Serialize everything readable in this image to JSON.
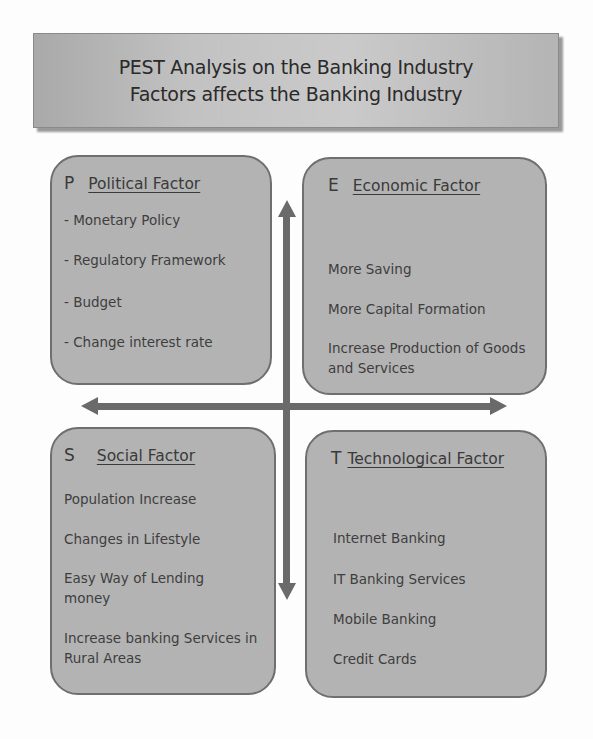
{
  "title": {
    "line1": "PEST Analysis on the Banking Industry",
    "line2": "Factors affects the Banking Industry"
  },
  "colors": {
    "box_fill": "#b3b3b3",
    "box_border": "#6f6f6f",
    "arrow": "#6a6a6a",
    "text": "#3a3a3a"
  },
  "quadrants": {
    "political": {
      "letter": "P",
      "title": "Political Factor",
      "items": [
        "- Monetary Policy",
        "- Regulatory Framework",
        "- Budget",
        "- Change interest rate"
      ]
    },
    "economic": {
      "letter": "E",
      "title": "Economic Factor",
      "items": [
        "More Saving",
        "More Capital Formation",
        "Increase Production of Goods and Services"
      ]
    },
    "social": {
      "letter": "S",
      "title": "Social Factor",
      "items": [
        "Population Increase",
        "Changes in Lifestyle",
        "Easy Way of Lending money",
        "Increase banking Services in Rural Areas"
      ]
    },
    "technological": {
      "letter": "T",
      "title": "Technological Factor",
      "items": [
        "Internet Banking",
        "IT Banking Services",
        "Mobile Banking",
        "Credit Cards"
      ]
    }
  },
  "arrows": {
    "vertical": "double-headed-vertical-arrow",
    "horizontal": "double-headed-horizontal-arrow"
  }
}
